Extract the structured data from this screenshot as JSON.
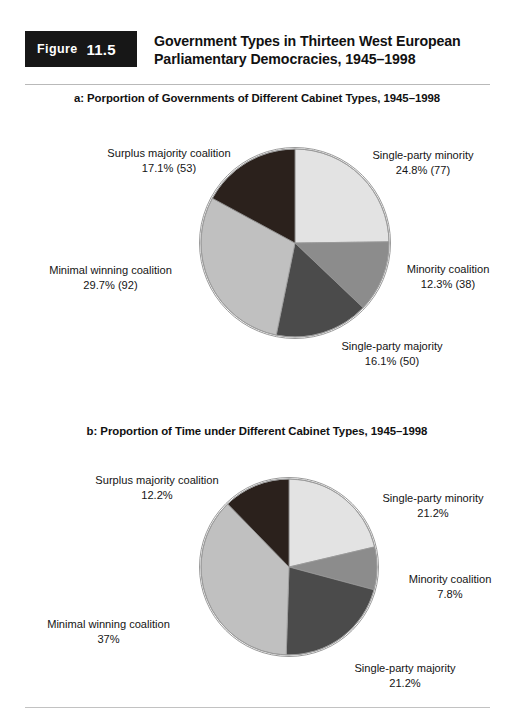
{
  "figure": {
    "badge_label": "Figure",
    "badge_number": "11.5",
    "title_line1": "Government Types in Thirteen West European",
    "title_line2": "Parliamentary Democracies, 1945–1998"
  },
  "colors": {
    "single_party_minority": "#e3e3e3",
    "minority_coalition": "#8c8c8c",
    "single_party_majority": "#4b4b4b",
    "minimal_winning_coalition": "#c0c0c0",
    "surplus_majority_coalition": "#2b211c",
    "outline": "#9a9a9a",
    "badge_bg": "#171717",
    "rule": "#b9b9b9"
  },
  "chart_data": [
    {
      "type": "pie",
      "id": "panel-a",
      "title": "a: Porportion of Governments of Different Cabinet Types, 1945–1998",
      "unit": "percent",
      "start_angle_deg": 0,
      "direction": "clockwise",
      "categories": [
        "Single-party minority",
        "Minority coalition",
        "Single-party majority",
        "Minimal winning coalition",
        "Surplus majority coalition"
      ],
      "values": [
        24.8,
        12.3,
        16.1,
        29.7,
        17.1
      ],
      "counts": [
        77,
        38,
        50,
        92,
        53
      ],
      "slices": [
        {
          "name": "Single-party minority",
          "percent": 24.8,
          "count": 77,
          "label_name": "Single-party minority",
          "label_value": "24.8% (77)",
          "color": "#e3e3e3"
        },
        {
          "name": "Minority coalition",
          "percent": 12.3,
          "count": 38,
          "label_name": "Minority coalition",
          "label_value": "12.3% (38)",
          "color": "#8c8c8c"
        },
        {
          "name": "Single-party majority",
          "percent": 16.1,
          "count": 50,
          "label_name": "Single-party majority",
          "label_value": "16.1% (50)",
          "color": "#4b4b4b"
        },
        {
          "name": "Minimal winning coalition",
          "percent": 29.7,
          "count": 92,
          "label_name": "Minimal winning coalition",
          "label_value": "29.7% (92)",
          "color": "#c0c0c0"
        },
        {
          "name": "Surplus majority coalition",
          "percent": 17.1,
          "count": 53,
          "label_name": "Surplus majority coalition",
          "label_value": "17.1% (53)",
          "color": "#2b211c"
        }
      ],
      "legend": "none"
    },
    {
      "type": "pie",
      "id": "panel-b",
      "title": "b: Proportion of Time under Different Cabinet Types, 1945–1998",
      "unit": "percent",
      "start_angle_deg": 0,
      "direction": "clockwise",
      "categories": [
        "Single-party minority",
        "Minority coalition",
        "Single-party majority",
        "Minimal winning coalition",
        "Surplus majority coalition"
      ],
      "values": [
        21.2,
        7.8,
        21.2,
        37,
        12.2
      ],
      "slices": [
        {
          "name": "Single-party minority",
          "percent": 21.2,
          "label_name": "Single-party minority",
          "label_value": "21.2%",
          "color": "#e3e3e3"
        },
        {
          "name": "Minority coalition",
          "percent": 7.8,
          "label_name": "Minority coalition",
          "label_value": "7.8%",
          "color": "#8c8c8c"
        },
        {
          "name": "Single-party majority",
          "percent": 21.2,
          "label_name": "Single-party majority",
          "label_value": "21.2%",
          "color": "#4b4b4b"
        },
        {
          "name": "Minimal winning coalition",
          "percent": 37,
          "label_name": "Minimal winning coalition",
          "label_value": "37%",
          "color": "#c0c0c0"
        },
        {
          "name": "Surplus majority coalition",
          "percent": 12.2,
          "label_name": "Surplus majority coalition",
          "label_value": "12.2%",
          "color": "#2b211c"
        }
      ],
      "legend": "none"
    }
  ]
}
